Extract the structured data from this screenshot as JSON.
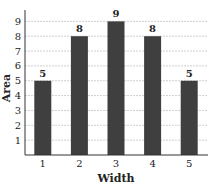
{
  "chart_data": {
    "type": "bar",
    "title": "",
    "xlabel": "Width",
    "ylabel": "Area",
    "categories": [
      "1",
      "2",
      "3",
      "4",
      "5"
    ],
    "values": [
      5,
      8,
      9,
      8,
      5
    ],
    "data_labels": [
      "5",
      "8",
      "9",
      "8",
      "5"
    ],
    "yticks": [
      1,
      2,
      3,
      4,
      5,
      6,
      7,
      8,
      9
    ],
    "ylim": [
      0,
      9.8
    ],
    "grid": true,
    "legend": null,
    "bar_color": "#3f3f3f"
  }
}
